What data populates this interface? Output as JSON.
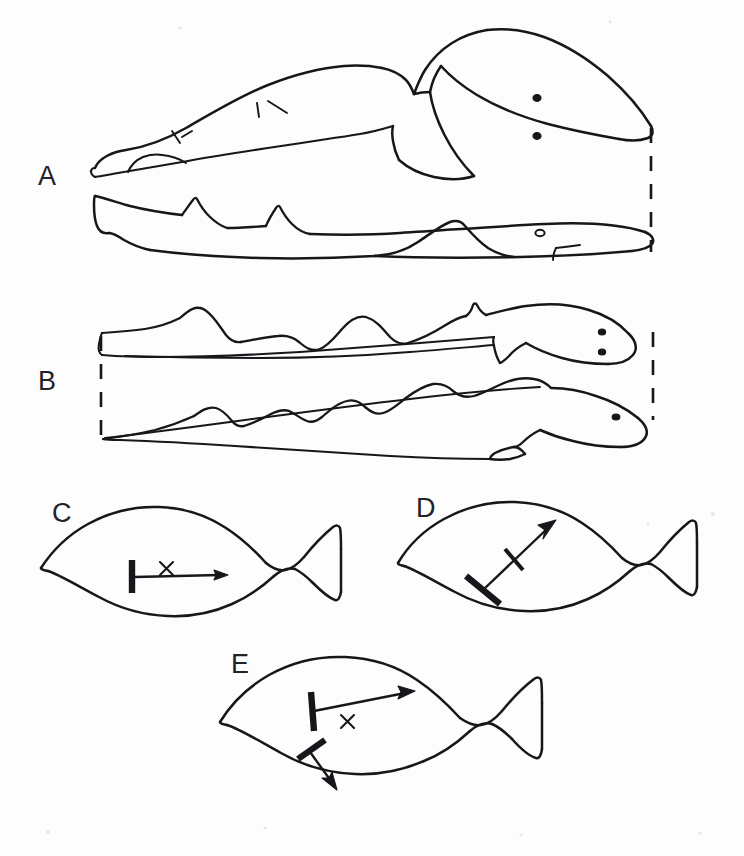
{
  "figure": {
    "background_color": "#fdfdfd",
    "ink_color": "#17161a",
    "width": 744,
    "height": 856
  },
  "panels": [
    {
      "id": "A",
      "label": "A",
      "label_x": 38,
      "label_y": 185,
      "caption": "Shark (heterocercal tail) shown in two postures with dashed vertical reference line at the snout",
      "subjects": [
        {
          "name": "shark-upper",
          "description": "shark with large heterocercal caudal fin, two dorsal fins, two eye spots"
        },
        {
          "name": "shark-lower",
          "description": "streamlined shark silhouette with two triangular dorsal fins and one eye"
        }
      ],
      "reference_line": {
        "name": "dashed-reference-line-a",
        "orientation": "vertical",
        "x": 651,
        "y1": 128,
        "y2": 252
      }
    },
    {
      "id": "B",
      "label": "B",
      "label_x": 38,
      "label_y": 390,
      "caption": "Elongate cod-like fish shown twice with undulating dorsal fin profiles and dashed reference lines at head and tail",
      "subjects": [
        {
          "name": "fish-upper-b",
          "description": "slender fish with three rounded dorsal humps, pointing right"
        },
        {
          "name": "fish-lower-b",
          "description": "slender fish with low wavy dorsal ridge and pelvic fin, pointing right"
        }
      ],
      "reference_lines": [
        {
          "name": "dashed-reference-line-b-left",
          "orientation": "vertical",
          "x": 101,
          "y1": 333,
          "y2": 438
        },
        {
          "name": "dashed-reference-line-b-right",
          "orientation": "vertical",
          "x": 653,
          "y1": 330,
          "y2": 420
        }
      ]
    },
    {
      "id": "C",
      "label": "C",
      "label_x": 52,
      "label_y": 522,
      "caption": "Generic fish with centre of mass and a horizontal backward-directed pectoral fin force",
      "center_of_mass": {
        "name": "center-of-mass-marker",
        "symbol": "x",
        "x": 166,
        "y": 568
      },
      "vectors": [
        {
          "name": "force-vector-horizontal",
          "direction": "right",
          "from_x": 133,
          "from_y": 578,
          "to_x": 226,
          "to_y": 575
        }
      ],
      "fin_bars": [
        {
          "name": "pectoral-fin-bar",
          "x1": 131,
          "y1": 562,
          "x2": 131,
          "y2": 592,
          "weight": "thick"
        }
      ]
    },
    {
      "id": "D",
      "label": "D",
      "label_x": 416,
      "label_y": 517,
      "caption": "Generic fish with an obliquely upward-directed pectoral fin force vector crossed by a tick",
      "vectors": [
        {
          "name": "force-vector-oblique-up",
          "direction": "up-right",
          "from_x": 482,
          "from_y": 589,
          "to_x": 553,
          "to_y": 521
        }
      ],
      "fin_bars": [
        {
          "name": "pectoral-fin-bar",
          "x1": 466,
          "y1": 577,
          "x2": 499,
          "y2": 603,
          "weight": "thick"
        },
        {
          "name": "vector-tick-mark",
          "x1": 508,
          "y1": 551,
          "x2": 523,
          "y2": 568,
          "weight": "medium"
        }
      ]
    },
    {
      "id": "E",
      "label": "E",
      "label_x": 231,
      "label_y": 673,
      "caption": "Generic fish with opposing pectoral and pelvic fin force vectors about the centre of mass",
      "center_of_mass": {
        "name": "center-of-mass-marker",
        "symbol": "x",
        "x": 347,
        "y": 721
      },
      "vectors": [
        {
          "name": "force-vector-pectoral-up",
          "direction": "up-right",
          "from_x": 313,
          "from_y": 710,
          "to_x": 414,
          "to_y": 692
        },
        {
          "name": "force-vector-pelvic-down",
          "direction": "down-right",
          "from_x": 311,
          "from_y": 755,
          "to_x": 337,
          "to_y": 789
        }
      ],
      "fin_bars": [
        {
          "name": "pectoral-fin-bar",
          "x1": 311,
          "y1": 693,
          "x2": 313,
          "y2": 730,
          "weight": "thick"
        },
        {
          "name": "pelvic-fin-bar",
          "x1": 299,
          "y1": 757,
          "x2": 324,
          "y2": 741,
          "weight": "thick"
        }
      ]
    }
  ],
  "legend": {
    "cross_symbol": "x",
    "cross_meaning": "centre of mass"
  }
}
